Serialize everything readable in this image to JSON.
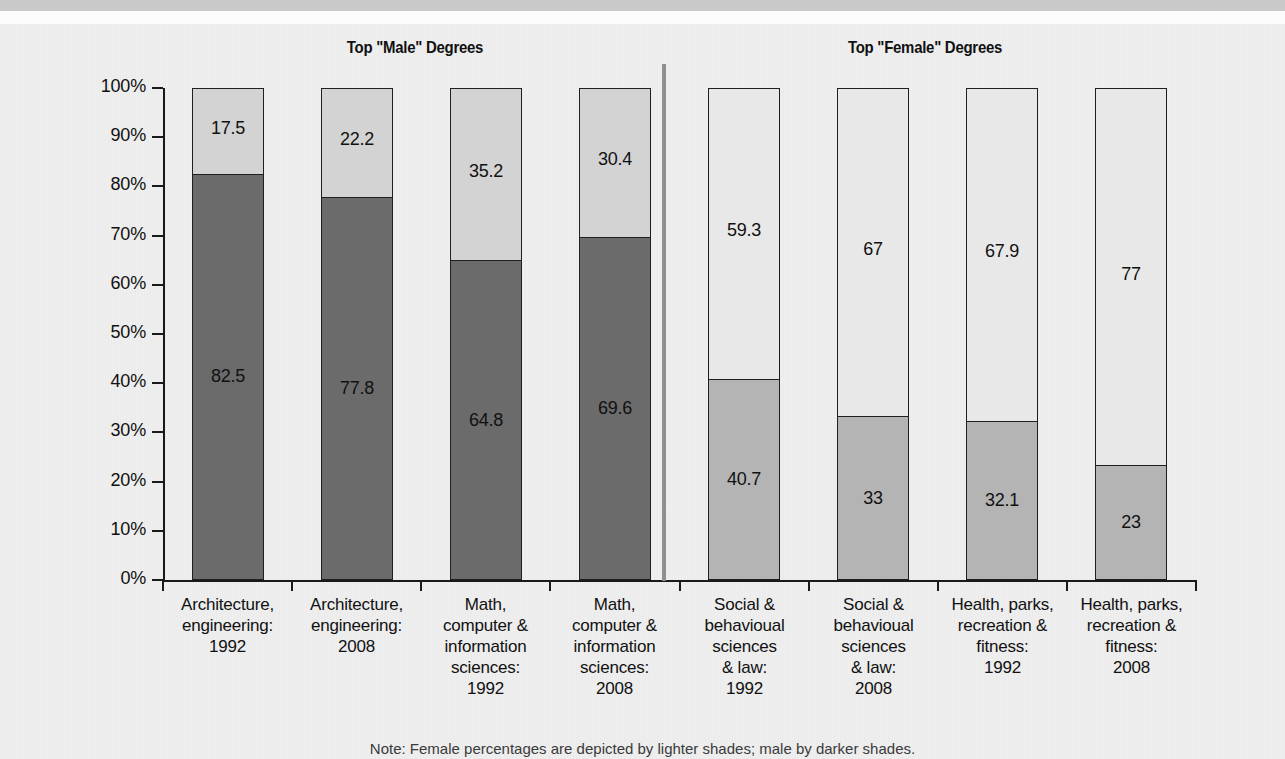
{
  "chart_data": {
    "type": "bar",
    "subtype": "stacked-100-percent",
    "title": "",
    "panels": [
      {
        "title": "Top \"Male\" Degrees",
        "categories": [
          "Architecture, engineering: 1992",
          "Architecture, engineering: 2008",
          "Math, computer & information sciences: 1992",
          "Math, computer & information sciences: 2008"
        ],
        "series": [
          {
            "name": "Male",
            "values": [
              82.5,
              77.8,
              64.8,
              69.6
            ]
          },
          {
            "name": "Female",
            "values": [
              17.5,
              22.2,
              35.2,
              30.4
            ]
          }
        ]
      },
      {
        "title": "Top \"Female\" Degrees",
        "categories": [
          "Social & behavioural sciences & law: 1992",
          "Social & behavioural sciences & law: 2008",
          "Health, parks, recreation & fitness: 1992",
          "Health, parks, recreation & fitness: 2008"
        ],
        "series": [
          {
            "name": "Male",
            "values": [
              40.7,
              33,
              32.1,
              23
            ]
          },
          {
            "name": "Female",
            "values": [
              59.3,
              67,
              67.9,
              77
            ]
          }
        ]
      }
    ],
    "xlabel": "",
    "ylabel": "",
    "ylim": [
      0,
      100
    ],
    "yticks": [
      "0%",
      "10%",
      "20%",
      "30%",
      "40%",
      "50%",
      "60%",
      "70%",
      "80%",
      "90%",
      "100%"
    ],
    "grid": false,
    "legend": "none",
    "note": "Note: Female percentages are depicted by lighter shades; male by darker shades."
  },
  "titles": {
    "male_panel": "Top \"Male\" Degrees",
    "female_panel": "Top \"Female\" Degrees"
  },
  "yticks": [
    {
      "label": "100%"
    },
    {
      "label": "90%"
    },
    {
      "label": "80%"
    },
    {
      "label": "70%"
    },
    {
      "label": "60%"
    },
    {
      "label": "50%"
    },
    {
      "label": "40%"
    },
    {
      "label": "30%"
    },
    {
      "label": "20%"
    },
    {
      "label": "10%"
    },
    {
      "label": "0%"
    }
  ],
  "bars": [
    {
      "panel": "male",
      "top_value": "17.5",
      "bottom_value": "82.5",
      "top_pct": 17.5,
      "bottom_pct": 82.5,
      "label_lines": [
        "Architecture,",
        "engineering:",
        "1992"
      ]
    },
    {
      "panel": "male",
      "top_value": "22.2",
      "bottom_value": "77.8",
      "top_pct": 22.2,
      "bottom_pct": 77.8,
      "label_lines": [
        "Architecture,",
        "engineering:",
        "2008"
      ]
    },
    {
      "panel": "male",
      "top_value": "35.2",
      "bottom_value": "64.8",
      "top_pct": 35.2,
      "bottom_pct": 64.8,
      "label_lines": [
        "Math,",
        "computer &",
        "information",
        "sciences:",
        "1992"
      ]
    },
    {
      "panel": "male",
      "top_value": "30.4",
      "bottom_value": "69.6",
      "top_pct": 30.4,
      "bottom_pct": 69.6,
      "label_lines": [
        "Math,",
        "computer &",
        "information",
        "sciences:",
        "2008"
      ]
    },
    {
      "panel": "female",
      "top_value": "59.3",
      "bottom_value": "40.7",
      "top_pct": 59.3,
      "bottom_pct": 40.7,
      "label_lines": [
        "Social &",
        "behavioual",
        "sciences",
        "& law:",
        "1992"
      ]
    },
    {
      "panel": "female",
      "top_value": "67",
      "bottom_value": "33",
      "top_pct": 67,
      "bottom_pct": 33,
      "label_lines": [
        "Social &",
        "behavioual",
        "sciences",
        "& law:",
        "2008"
      ]
    },
    {
      "panel": "female",
      "top_value": "67.9",
      "bottom_value": "32.1",
      "top_pct": 67.9,
      "bottom_pct": 32.1,
      "label_lines": [
        "Health, parks,",
        "recreation &",
        "fitness:",
        "1992"
      ]
    },
    {
      "panel": "female",
      "top_value": "77",
      "bottom_value": "23",
      "top_pct": 77,
      "bottom_pct": 23,
      "label_lines": [
        "Health, parks,",
        "recreation &",
        "fitness:",
        "2008"
      ]
    }
  ],
  "note": "Note: Female percentages are depicted by lighter shades; male by darker shades.",
  "colors": {
    "male_dark": "#6b6b6b",
    "female_light_on_dark": "#d3d3d3",
    "male_medium": "#b4b4b4",
    "female_white": "#e8e8e8",
    "axis": "#1a1a1a",
    "divider": "#8f8f8f",
    "paper": "#eeeeee"
  }
}
